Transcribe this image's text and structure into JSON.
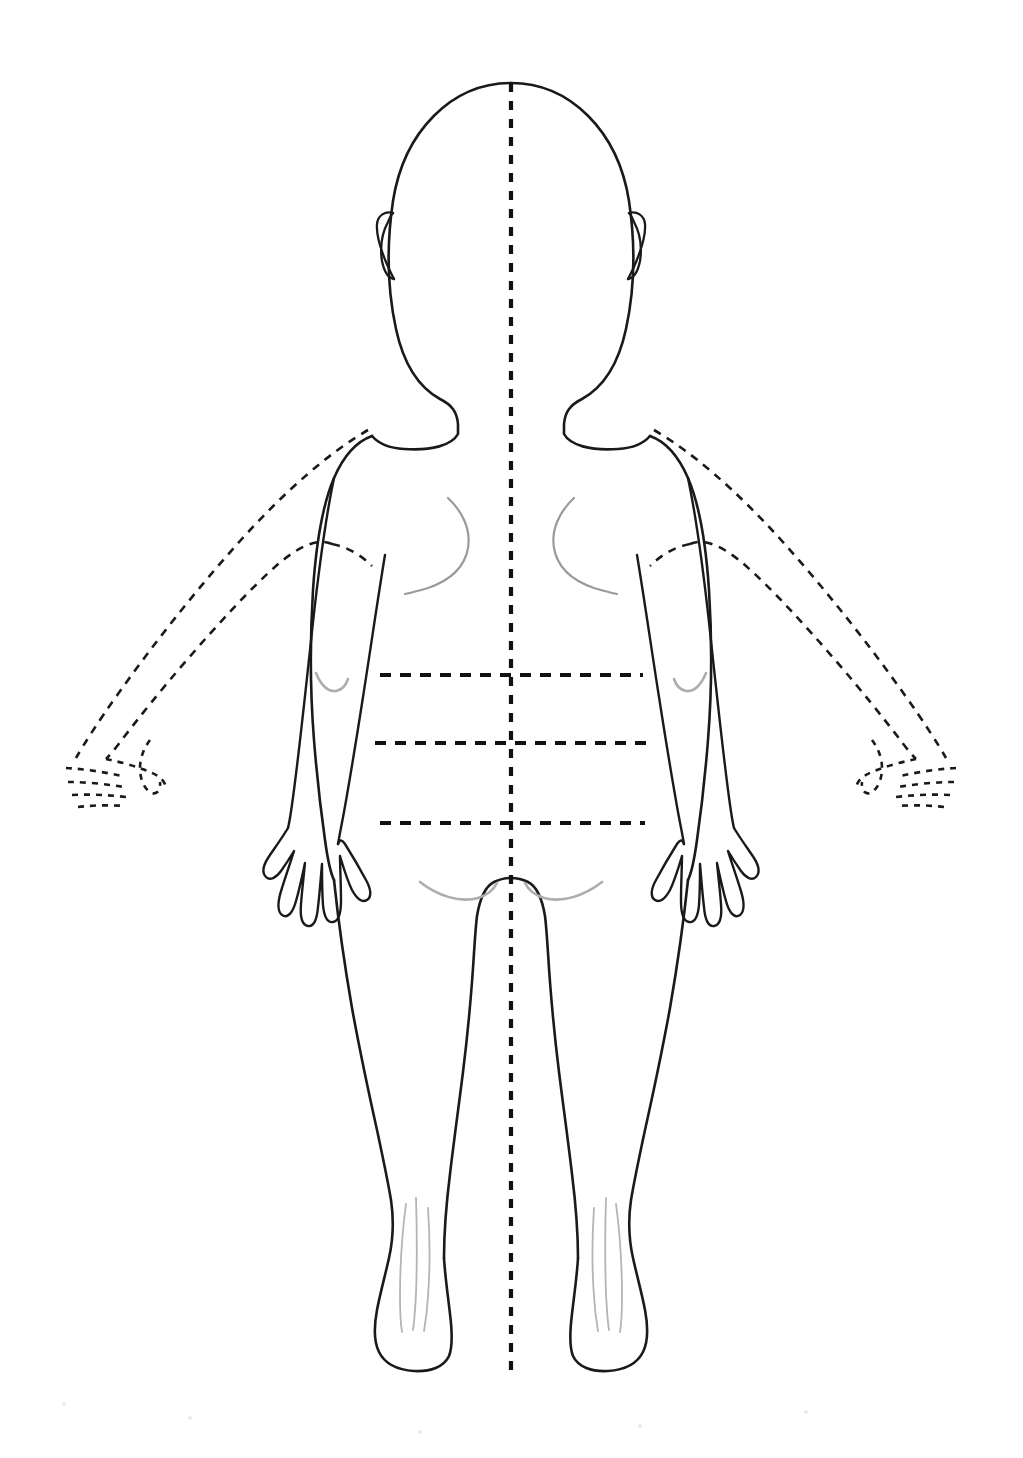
{
  "document": {
    "title": "Pediatric Body Outline Diagram",
    "view": "Posterior (back) view",
    "subject": "Young child / toddler body map",
    "background_color": "#ffffff",
    "line_color": "#1a1a1a",
    "shading_color": "#9a9a9a",
    "canvas": {
      "width": 1023,
      "height": 1458
    }
  },
  "figure": {
    "name": "child-body-outline",
    "pose": "standing, arms at sides",
    "midline": {
      "label": "vertical midline",
      "style": "dashed",
      "x": 511,
      "y_top": 83,
      "y_bottom": 1378
    },
    "regions": [
      {
        "name": "head",
        "label": "Head"
      },
      {
        "name": "ear-left",
        "label": "Left ear"
      },
      {
        "name": "ear-right",
        "label": "Right ear"
      },
      {
        "name": "neck",
        "label": "Neck"
      },
      {
        "name": "shoulders",
        "label": "Shoulders"
      },
      {
        "name": "torso",
        "label": "Trunk / back"
      },
      {
        "name": "arm-left",
        "label": "Left arm"
      },
      {
        "name": "arm-right",
        "label": "Right arm"
      },
      {
        "name": "hand-left",
        "label": "Left hand"
      },
      {
        "name": "hand-right",
        "label": "Right hand"
      },
      {
        "name": "buttocks",
        "label": "Buttocks"
      },
      {
        "name": "leg-left",
        "label": "Left leg"
      },
      {
        "name": "leg-right",
        "label": "Right leg"
      },
      {
        "name": "foot-left",
        "label": "Left foot"
      },
      {
        "name": "foot-right",
        "label": "Right foot"
      }
    ],
    "alt_arms": {
      "label": "Alternate abducted arm position",
      "style": "dashed",
      "sides": [
        "left",
        "right"
      ],
      "includes_hand": true
    },
    "quadrant_lines": [
      {
        "name": "upper-trunk-line",
        "label": "Upper transverse reference line",
        "y": 675,
        "x_start": 380,
        "x_end": 643,
        "style": "dashed"
      },
      {
        "name": "mid-trunk-line",
        "label": "Mid transverse reference line",
        "y": 743,
        "x_start": 375,
        "x_end": 648,
        "style": "dashed"
      },
      {
        "name": "lower-trunk-line",
        "label": "Lower transverse reference line",
        "y": 823,
        "x_start": 380,
        "x_end": 645,
        "style": "dashed"
      }
    ],
    "shading_marks": [
      {
        "name": "scapula-left",
        "label": "Left scapular border"
      },
      {
        "name": "scapula-right",
        "label": "Right scapular border"
      },
      {
        "name": "elbow-crease-left",
        "label": "Left elbow crease"
      },
      {
        "name": "elbow-crease-right",
        "label": "Right elbow crease"
      },
      {
        "name": "gluteal-fold-left",
        "label": "Left gluteal fold"
      },
      {
        "name": "gluteal-fold-right",
        "label": "Right gluteal fold"
      },
      {
        "name": "achilles-left",
        "label": "Left Achilles tendon"
      },
      {
        "name": "achilles-right",
        "label": "Right Achilles tendon"
      }
    ]
  }
}
